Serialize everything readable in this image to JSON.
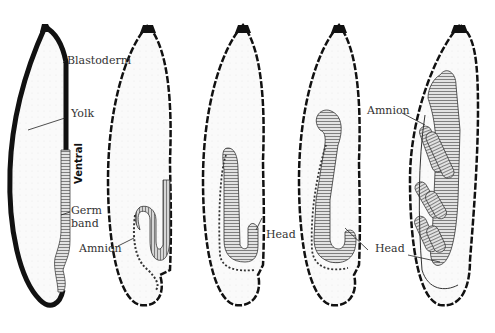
{
  "diagram": {
    "type": "insect embryo development stages",
    "stages": [
      {
        "index": 1,
        "labels": [
          "Blastoderm",
          "Yolk",
          "Ventral",
          "Germ band"
        ]
      },
      {
        "index": 2,
        "labels": [
          "Amnion"
        ]
      },
      {
        "index": 3,
        "labels": [
          "Head"
        ]
      },
      {
        "index": 4,
        "labels": [
          "Head"
        ]
      },
      {
        "index": 5,
        "labels": [
          "Amnion",
          "Head"
        ]
      }
    ],
    "labels": {
      "blastoderm": "Blastoderm",
      "yolk": "Yolk",
      "ventral": "Ventral",
      "germ_line1": "Germ",
      "germ_line2": "band",
      "amnion_stage2": "Amnion",
      "head_stage3": "Head",
      "head_stage4": "Head",
      "amnion_stage5": "Amnion",
      "head_stage5": "Head"
    },
    "colors": {
      "outline": "#111111",
      "yolk_fill": "#f7f7f7",
      "germband_fill": "#d8d8d8",
      "label_text": "#333333"
    }
  }
}
